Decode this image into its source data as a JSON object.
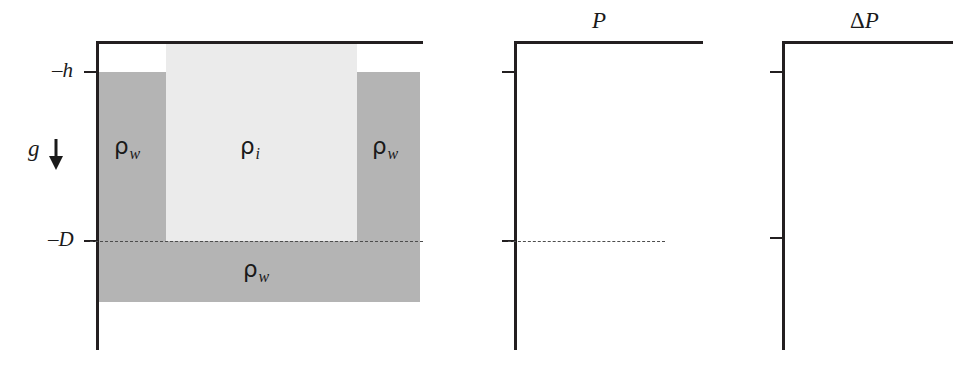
{
  "figure": {
    "background_color": "#ffffff",
    "line_color": "#231f20",
    "dash_color": "#4d4d4d"
  },
  "colors": {
    "water_fill": "#b4b4b4",
    "ice_fill": "#ebebeb",
    "ink": "#1a1a1a"
  },
  "left_panel": {
    "name": "ice-water-geometry",
    "tick_labels": {
      "h": "–h",
      "D": "–D"
    },
    "gravity": {
      "symbol": "g",
      "arrow_direction": "down",
      "arrow_glyph": "↓"
    },
    "regions": [
      {
        "id": "water-upper-left",
        "material": "water",
        "rho": "ρ",
        "subscript": "w",
        "fill": "#b4b4b4"
      },
      {
        "id": "ice-block",
        "material": "ice",
        "rho": "ρ",
        "subscript": "i",
        "fill": "#ebebeb"
      },
      {
        "id": "water-upper-right",
        "material": "water",
        "rho": "ρ",
        "subscript": "w",
        "fill": "#b4b4b4"
      },
      {
        "id": "water-lower",
        "material": "water",
        "rho": "ρ",
        "subscript": "w",
        "fill": "#b4b4b4"
      }
    ]
  },
  "middle_panel": {
    "name": "pressure-profile",
    "axis_label": "P",
    "has_dashed_level_line": true
  },
  "right_panel": {
    "name": "pressure-anomaly-profile",
    "axis_label_delta": "Δ",
    "axis_label_var": "P",
    "has_dashed_level_line": false
  }
}
